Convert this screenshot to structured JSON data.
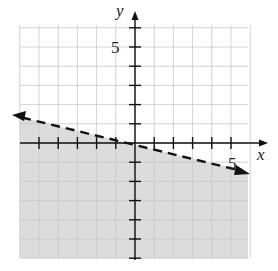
{
  "chart_data": {
    "type": "line",
    "title": "",
    "xlabel": "x",
    "ylabel": "y",
    "xlim": [
      -6,
      6
    ],
    "ylim": [
      -6,
      6
    ],
    "grid": true,
    "tick_labels": {
      "x": [
        "5"
      ],
      "y": [
        "5"
      ]
    },
    "boundary_line": {
      "equation": "y = -x/4",
      "slope": -0.25,
      "intercept": 0,
      "style": "dashed",
      "arrows": "both",
      "points": [
        [
          -6.5,
          1.6
        ],
        [
          0,
          0
        ],
        [
          5,
          -1.25
        ],
        [
          6,
          -1.5
        ]
      ]
    },
    "shaded_region": "below the line",
    "inequality": "y < -x/4",
    "colors": {
      "shade": "#dcdcdc",
      "grid": "#c8c8c8",
      "axis": "#111111",
      "line": "#111111"
    }
  },
  "labels": {
    "x_axis": "x",
    "y_axis": "y",
    "x_tick": "5",
    "y_tick": "5"
  }
}
